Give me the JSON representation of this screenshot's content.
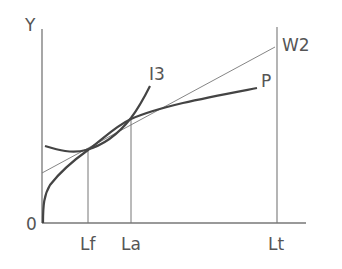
{
  "diagram": {
    "type": "production-function-diagram",
    "axes": {
      "y_label": "Y",
      "origin_label": "0"
    },
    "x_markers": [
      {
        "id": "lf",
        "label": "Lf",
        "x": 88
      },
      {
        "id": "la",
        "label": "La",
        "x": 131
      },
      {
        "id": "lt",
        "label": "Lt",
        "x": 277
      }
    ],
    "curves": [
      {
        "id": "w2",
        "label": "W2",
        "style": "thin line"
      },
      {
        "id": "p",
        "label": "P",
        "style": "thick curve"
      },
      {
        "id": "i3",
        "label": "I3",
        "style": "thick curve"
      }
    ],
    "colors": {
      "axis": "#777777",
      "curve": "#444444",
      "label": "#555555",
      "background": "#ffffff"
    }
  }
}
